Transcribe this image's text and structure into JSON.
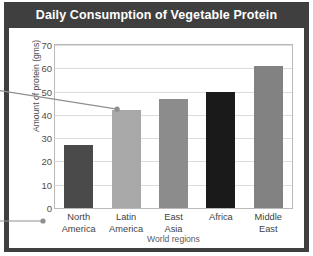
{
  "chart_data": {
    "type": "bar",
    "title": "Daily Consumption of Vegetable Protein",
    "xlabel": "World regions",
    "ylabel": "Amount of protein (gms)",
    "categories": [
      "North America",
      "Latin America",
      "East Asia",
      "Africa",
      "Middle East"
    ],
    "category_lines": [
      [
        "North",
        "America"
      ],
      [
        "Latin",
        "America"
      ],
      [
        "East",
        "Asia"
      ],
      [
        "Africa",
        ""
      ],
      [
        "Middle",
        "East"
      ]
    ],
    "values": [
      27,
      42,
      47,
      50,
      61
    ],
    "ylim": [
      0,
      70
    ],
    "yticks": [
      0,
      10,
      20,
      30,
      40,
      50,
      60,
      70
    ],
    "ytick_labels": [
      "0",
      "10",
      "20",
      "30",
      "40",
      "50",
      "60",
      "70"
    ],
    "grid": true,
    "legend": "none",
    "bar_colors": [
      "#4a4a4a",
      "#a8a8a8",
      "#8c8c8c",
      "#1a1a1a",
      "#828282"
    ],
    "annotations": [
      {
        "name": "leader-line-latin-america-bar",
        "target": "Latin America bar top",
        "dot_color": "#8f8f8f",
        "line_color": "#8f8f8f"
      },
      {
        "name": "leader-line-north-america-label",
        "target": "North America category label",
        "dot_color": "#8f8f8f",
        "line_color": "#8f8f8f"
      }
    ]
  },
  "theme": {
    "frame_color": "#3f3f3f",
    "title_text_color": "#ffffff",
    "plot_background": "#ffffff",
    "gridline_color": "#dcdcdc",
    "axis_border_color": "#b9b9b9",
    "tick_text_color": "#4d4d4d"
  }
}
